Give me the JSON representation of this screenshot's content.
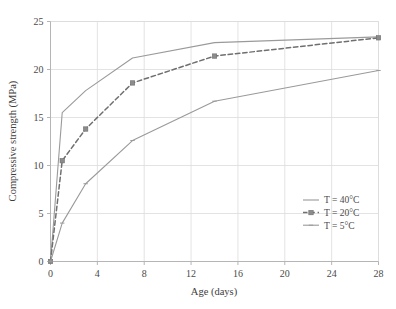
{
  "chart_data": {
    "type": "line",
    "title": "",
    "subtitle": "",
    "xlabel": "Age (days)",
    "ylabel": "Compressive strength (MPa)",
    "xlim": [
      0,
      28
    ],
    "ylim": [
      0,
      25
    ],
    "xticks": [
      0,
      4,
      8,
      12,
      16,
      20,
      24,
      28
    ],
    "yticks": [
      0,
      5,
      10,
      15,
      20,
      25
    ],
    "xtick_labels": [
      "0",
      "4",
      "8",
      "12",
      "16",
      "20",
      "24",
      "28"
    ],
    "ytick_labels": [
      "0",
      "5",
      "10",
      "15",
      "20",
      "25"
    ],
    "grid": true,
    "grid_color": "#dcdcdc",
    "legend_position": "lower-right-inside",
    "x": [
      0,
      1,
      3,
      7,
      14,
      28
    ],
    "series": [
      {
        "name": "T = 40°C",
        "values": [
          0,
          15.5,
          17.8,
          21.2,
          22.8,
          23.4
        ],
        "line_style": "solid",
        "marker": "none",
        "color": "#9a9a9a"
      },
      {
        "name": "T = 20°C",
        "values": [
          0,
          10.5,
          13.8,
          18.6,
          21.4,
          23.3
        ],
        "line_style": "dashed",
        "marker": "square",
        "color": "#6f6f6f"
      },
      {
        "name": "T = 5°C",
        "values": [
          0,
          4.0,
          8.1,
          12.6,
          16.7,
          19.9
        ],
        "line_style": "solid",
        "marker": "tick",
        "color": "#9a9a9a"
      }
    ]
  },
  "legend": {
    "items": [
      {
        "label": "T = 40°C"
      },
      {
        "label": "T = 20°C"
      },
      {
        "label": "T = 5°C"
      }
    ]
  },
  "colors": {
    "background": "#ffffff",
    "axis": "#b5b5b5",
    "grid": "#dcdcdc",
    "text": "#4a4a4a",
    "series_40": "#9a9a9a",
    "series_20": "#6f6f6f",
    "series_5": "#9a9a9a"
  }
}
